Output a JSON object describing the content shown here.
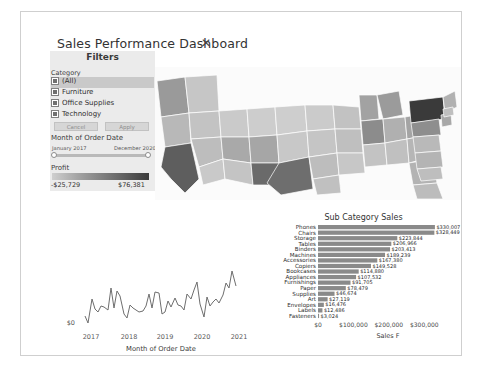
{
  "dashboard": {
    "title": "Sales Performance Dashboard",
    "close_label": "✕"
  },
  "filters": {
    "panel_title": "Filters",
    "category_label": "Category",
    "categories": [
      {
        "label": "(All)",
        "checked": true
      },
      {
        "label": "Furniture",
        "checked": true
      },
      {
        "label": "Office Supplies",
        "checked": true
      },
      {
        "label": "Technology",
        "checked": true
      }
    ],
    "cancel_label": "Cancel",
    "apply_label": "Apply",
    "date_label": "Month of Order Date",
    "date_start": "January 2017",
    "date_end": "December 2020",
    "profit_label": "Profit",
    "profit_min": "-$25,729",
    "profit_max": "$76,381"
  },
  "line_chart": {
    "type": "line",
    "title": "",
    "xlabel": "Month of Order Date",
    "ylabel": "",
    "yticks": [
      "$0"
    ],
    "xticks": [
      "2017",
      "2018",
      "2019",
      "2020",
      "2021"
    ],
    "x": [
      "2017-01",
      "2017-02",
      "2017-03",
      "2017-04",
      "2017-05",
      "2017-06",
      "2017-07",
      "2017-08",
      "2017-09",
      "2017-10",
      "2017-11",
      "2017-12",
      "2018-01",
      "2018-02",
      "2018-03",
      "2018-04",
      "2018-05",
      "2018-06",
      "2018-07",
      "2018-08",
      "2018-09",
      "2018-10",
      "2018-11",
      "2018-12",
      "2019-01",
      "2019-02",
      "2019-03",
      "2019-04",
      "2019-05",
      "2019-06",
      "2019-07",
      "2019-08",
      "2019-09",
      "2019-10",
      "2019-11",
      "2019-12",
      "2020-01",
      "2020-02",
      "2020-03",
      "2020-04",
      "2020-05",
      "2020-06",
      "2020-07",
      "2020-08",
      "2020-09",
      "2020-10",
      "2020-11",
      "2020-12"
    ],
    "values": [
      14236,
      4520,
      55691,
      28295,
      23648,
      34595,
      33946,
      27909,
      81777,
      31453,
      78629,
      69545,
      18174,
      11951,
      38726,
      34196,
      30132,
      24221,
      28540,
      36882,
      63133,
      31003,
      75249,
      74543,
      18542,
      22979,
      51715,
      38750,
      56987,
      40344,
      39262,
      31116,
      73410,
      59688,
      79412,
      96999,
      43971,
      20301,
      58872,
      36522,
      44261,
      52982,
      45264,
      63121,
      87866,
      77777,
      118448,
      83829
    ]
  },
  "bar_chart": {
    "type": "bar",
    "title": "Sub Category Sales",
    "xlabel": "Sales F",
    "ylabel": "",
    "xticks": [
      "$0",
      "$100,000",
      "$200,000",
      "$300,000"
    ],
    "xlim": [
      0,
      350000
    ],
    "categories": [
      "Phones",
      "Chairs",
      "Storage",
      "Tables",
      "Binders",
      "Machines",
      "Accessories",
      "Copiers",
      "Bookcases",
      "Appliances",
      "Furnishings",
      "Paper",
      "Supplies",
      "Art",
      "Envelopes",
      "Labels",
      "Fasteners"
    ],
    "values": [
      330007,
      328449,
      223844,
      206966,
      203413,
      189239,
      167380,
      149528,
      114880,
      107532,
      91705,
      78479,
      46674,
      27119,
      16476,
      12486,
      3024
    ],
    "value_labels": [
      "$330,007",
      "$328,449",
      "$223,844",
      "$206,966",
      "$203,413",
      "$189,239",
      "$167,380",
      "$149,528",
      "$114,880",
      "$107,532",
      "$91,705",
      "$78,479",
      "$46,674",
      "$27,119",
      "$16,476",
      "$12,486",
      "$3,024"
    ]
  },
  "map": {
    "title": "",
    "highlight_state": "New York"
  },
  "colors": {
    "panel_bg": "#ebebeb",
    "bar_fill": "#8a8a8a",
    "line_stroke": "#6e6e6e",
    "accent_dark": "#3b3b3b"
  }
}
